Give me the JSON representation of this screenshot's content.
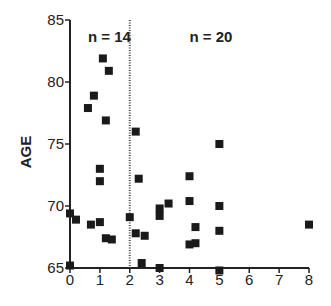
{
  "chart_data": {
    "type": "scatter",
    "title": "",
    "xlabel": "",
    "ylabel": "AGE",
    "xlim": [
      0,
      8
    ],
    "ylim": [
      65,
      85
    ],
    "xticks": [
      0,
      1,
      2,
      3,
      4,
      5,
      6,
      7,
      8
    ],
    "yticks": [
      65,
      70,
      75,
      80,
      85
    ],
    "grid": false,
    "divider": {
      "x": 2,
      "style": "dotted"
    },
    "annotations": [
      {
        "text": "n = 14",
        "x": 0.6,
        "y": 83.6
      },
      {
        "text": "n = 20",
        "x": 4.0,
        "y": 83.6
      }
    ],
    "series": [
      {
        "name": "group_left",
        "marker": "square",
        "points": [
          [
            1.1,
            81.9
          ],
          [
            1.3,
            80.9
          ],
          [
            0.8,
            78.9
          ],
          [
            0.6,
            77.9
          ],
          [
            1.2,
            76.9
          ],
          [
            1.0,
            73.0
          ],
          [
            1.0,
            72.0
          ],
          [
            0.0,
            69.4
          ],
          [
            0.2,
            68.9
          ],
          [
            0.7,
            68.5
          ],
          [
            1.0,
            68.7
          ],
          [
            1.2,
            67.4
          ],
          [
            1.4,
            67.3
          ],
          [
            0.0,
            65.2
          ]
        ]
      },
      {
        "name": "group_right",
        "marker": "square",
        "points": [
          [
            2.2,
            76.0
          ],
          [
            2.3,
            72.2
          ],
          [
            2.0,
            69.1
          ],
          [
            2.2,
            67.8
          ],
          [
            2.5,
            67.6
          ],
          [
            2.4,
            65.4
          ],
          [
            3.0,
            65.0
          ],
          [
            3.0,
            69.8
          ],
          [
            3.0,
            69.2
          ],
          [
            3.3,
            70.2
          ],
          [
            5.0,
            75.0
          ],
          [
            4.0,
            72.4
          ],
          [
            4.0,
            70.4
          ],
          [
            5.0,
            70.0
          ],
          [
            4.2,
            68.3
          ],
          [
            5.0,
            68.0
          ],
          [
            4.2,
            67.0
          ],
          [
            4.0,
            66.9
          ],
          [
            5.0,
            64.8
          ],
          [
            8.0,
            68.5
          ]
        ]
      }
    ]
  }
}
